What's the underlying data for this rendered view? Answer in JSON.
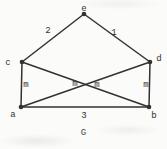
{
  "figure": {
    "caption": "G",
    "ink_color": "#333231",
    "background_color": "#fbfbfa",
    "canvas": {
      "width": 167,
      "height": 149
    },
    "graph": {
      "vertices": [
        {
          "id": "e",
          "x": 84,
          "y": 14,
          "label": "e",
          "lx": 84,
          "ly": 11
        },
        {
          "id": "c",
          "x": 22,
          "y": 62,
          "label": "c",
          "lx": 8,
          "ly": 65
        },
        {
          "id": "d",
          "x": 150,
          "y": 62,
          "label": "d",
          "lx": 159,
          "ly": 61
        },
        {
          "id": "a",
          "x": 21,
          "y": 107,
          "label": "a",
          "lx": 13,
          "ly": 117
        },
        {
          "id": "b",
          "x": 149,
          "y": 107,
          "label": "b",
          "lx": 154,
          "ly": 118
        }
      ],
      "edges": [
        {
          "from": "c",
          "to": "e",
          "label": "2",
          "lx": 48,
          "ly": 33
        },
        {
          "from": "e",
          "to": "d",
          "label": "1",
          "lx": 114,
          "ly": 35
        },
        {
          "from": "c",
          "to": "a",
          "label": "m",
          "lx": 26,
          "ly": 87
        },
        {
          "from": "d",
          "to": "b",
          "label": "m",
          "lx": 146,
          "ly": 87
        },
        {
          "from": "c",
          "to": "b",
          "label": "m",
          "lx": 75,
          "ly": 86
        },
        {
          "from": "a",
          "to": "d",
          "label": "m",
          "lx": 97,
          "ly": 87
        },
        {
          "from": "a",
          "to": "b",
          "label": "3",
          "lx": 84,
          "ly": 118
        }
      ]
    }
  }
}
